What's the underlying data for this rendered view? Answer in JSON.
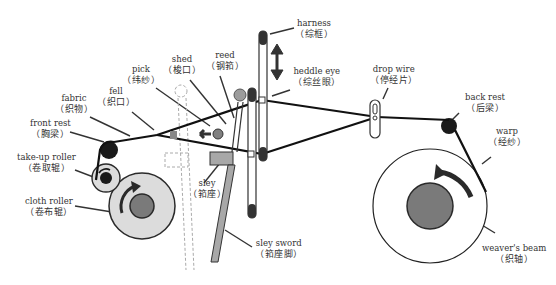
{
  "diagram": {
    "colors": {
      "line": "#1a1a1a",
      "roller_fill": "#dcdcdc",
      "core_fill": "#7a7a7a",
      "dark_fill": "#2a2a2a",
      "sley_fill": "#a8a8a8",
      "reed_ball": "#9c9c9c",
      "shuttle": "#808080"
    },
    "labels": {
      "harness": {
        "en": "harness",
        "zh": "（综框）"
      },
      "reed": {
        "en": "reed",
        "zh": "（钢筘）"
      },
      "shed": {
        "en": "shed",
        "zh": "（梭口）"
      },
      "pick": {
        "en": "pick",
        "zh": "（纬纱）"
      },
      "fell": {
        "en": "fell",
        "zh": "（织口）"
      },
      "fabric": {
        "en": "fabric",
        "zh": "（织物）"
      },
      "front_rest": {
        "en": "front rest",
        "zh": "（胸梁）"
      },
      "take_up_roller": {
        "en": "take-up roller",
        "zh": "（卷取辊）"
      },
      "cloth_roller": {
        "en": "cloth roller",
        "zh": "（卷布辊）"
      },
      "heddle_eye": {
        "en": "heddle eye",
        "zh": "（综丝眼）"
      },
      "drop_wire": {
        "en": "drop wire",
        "zh": "（停经片）"
      },
      "back_rest": {
        "en": "back rest",
        "zh": "（后梁）"
      },
      "warp": {
        "en": "warp",
        "zh": "（经纱）"
      },
      "weavers_beam": {
        "en": "weaver's beam",
        "zh": "（织轴）"
      },
      "sley": {
        "en": "sley",
        "zh": "（筘座）"
      },
      "sley_sword": {
        "en": "sley sword",
        "zh": "（筘座脚）"
      }
    }
  }
}
